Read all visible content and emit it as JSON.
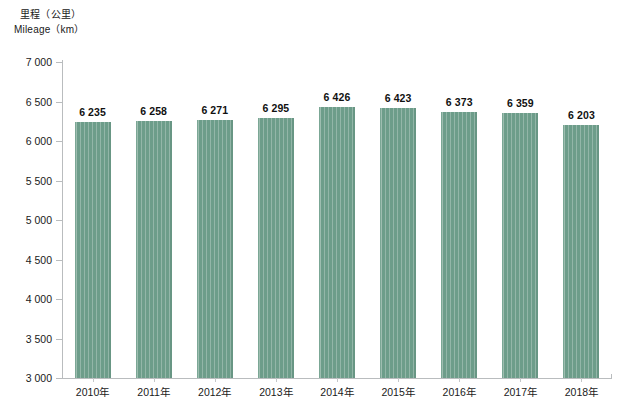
{
  "chart_data": {
    "type": "bar",
    "title": "",
    "axis_title_cn": "里程（公里）",
    "axis_title_en": "Mileage（km）",
    "xlabel": "",
    "ylabel": "里程（公里） / Mileage（km）",
    "categories": [
      "2010年",
      "2011年",
      "2012年",
      "2013年",
      "2014年",
      "2015年",
      "2016年",
      "2017年",
      "2018年"
    ],
    "values": [
      6235,
      6258,
      6271,
      6295,
      6426,
      6423,
      6373,
      6359,
      6203
    ],
    "value_labels": [
      "6 235",
      "6 258",
      "6 271",
      "6 295",
      "6 426",
      "6 423",
      "6 373",
      "6 359",
      "6 203"
    ],
    "ylim": [
      3000,
      7000
    ],
    "ytick_values": [
      3000,
      3500,
      4000,
      4500,
      5000,
      5500,
      6000,
      6500,
      7000
    ],
    "ytick_labels": [
      "3 000",
      "3 500",
      "4 000",
      "4 500",
      "5 000",
      "5 500",
      "6 000",
      "6 500",
      "7 000"
    ],
    "grid": false,
    "legend": null,
    "bar_color": "#6d9d8a",
    "axis_color": "#b9bcbe",
    "background_color": "#ffffff",
    "data_labels_shown": true
  }
}
